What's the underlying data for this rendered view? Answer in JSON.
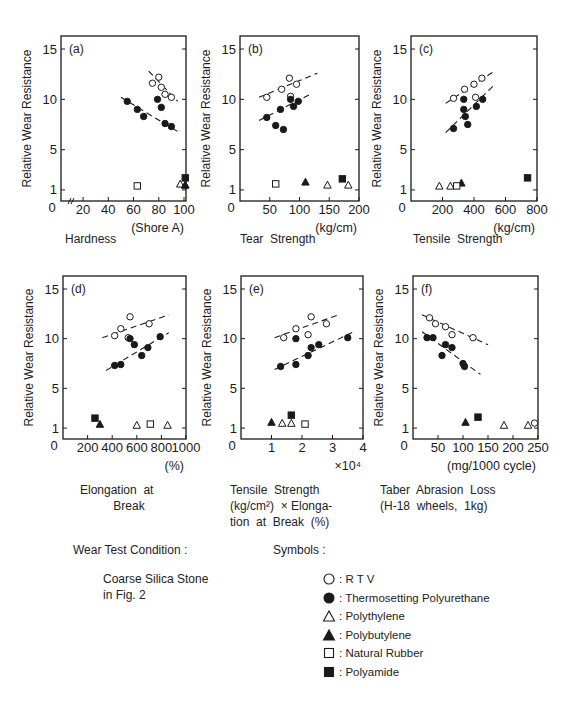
{
  "figure": {
    "ylabel": "Relative Wear Resistance",
    "colors": {
      "ink": "#1a1a1a",
      "background": "#ffffff"
    }
  },
  "symbols_legend": {
    "title": "Symbols :",
    "items": [
      {
        "marker": "open-circle",
        "label": "R T V"
      },
      {
        "marker": "filled-circle",
        "label": "Thermosetting Polyurethane"
      },
      {
        "marker": "open-triangle",
        "label": "Polythylene"
      },
      {
        "marker": "filled-triangle",
        "label": "Polybutylene"
      },
      {
        "marker": "open-square",
        "label": "Natural Rubber"
      },
      {
        "marker": "filled-square",
        "label": "Polyamide"
      }
    ]
  },
  "wear_test": {
    "title": "Wear Test Condition :",
    "line1": "Coarse Silica Stone",
    "line2": "in Fig. 2"
  },
  "chart_data": [
    {
      "id": "a",
      "type": "scatter",
      "panel_label": "(a)",
      "title": "Hardness",
      "xlabel": "(Shore A)",
      "ylabel": "Relative Wear Resistance",
      "xlim": [
        0,
        100
      ],
      "ylim": [
        0,
        16
      ],
      "xticks": [
        20,
        40,
        60,
        80,
        100
      ],
      "yticks": [
        1,
        5,
        10,
        15
      ],
      "axis_break": true,
      "box": {
        "x": 61,
        "y": 36,
        "w": 125,
        "h": 165
      },
      "xmap": [
        12,
        100
      ],
      "xpix": [
        73,
        184
      ],
      "series": [
        {
          "name": "R T V",
          "marker": "open-circle",
          "points": [
            [
              75,
              11.6
            ],
            [
              80,
              12.2
            ],
            [
              82,
              11.2
            ],
            [
              85,
              10.5
            ],
            [
              90,
              10.2
            ]
          ]
        },
        {
          "name": "Thermosetting Polyurethane",
          "marker": "filled-circle",
          "points": [
            [
              55,
              9.8
            ],
            [
              63,
              9.0
            ],
            [
              68,
              8.3
            ],
            [
              79,
              10.0
            ],
            [
              82,
              9.2
            ],
            [
              85,
              7.6
            ],
            [
              90,
              7.3
            ]
          ]
        },
        {
          "name": "Polythylene",
          "marker": "open-triangle",
          "points": [
            [
              97,
              1.6
            ],
            [
              101,
              1.5
            ]
          ]
        },
        {
          "name": "Polybutylene",
          "marker": "filled-triangle",
          "points": [
            [
              101,
              1.5
            ]
          ]
        },
        {
          "name": "Natural Rubber",
          "marker": "open-square",
          "points": [
            [
              63,
              1.4
            ]
          ]
        },
        {
          "name": "Polyamide",
          "marker": "filled-square",
          "points": [
            [
              101,
              2.2
            ]
          ]
        }
      ],
      "trendlines": [
        {
          "series": "R T V",
          "from": [
            72,
            12.8
          ],
          "to": [
            95,
            9.8
          ]
        },
        {
          "series": "Thermosetting Polyurethane",
          "from": [
            50,
            10.2
          ],
          "to": [
            95,
            6.8
          ]
        }
      ]
    },
    {
      "id": "b",
      "type": "scatter",
      "panel_label": "(b)",
      "title": "Tear Strength",
      "xlabel": "(kg/cm)",
      "ylabel": "Relative Wear Resistance",
      "xlim": [
        0,
        200
      ],
      "ylim": [
        0,
        16
      ],
      "xticks": [
        50,
        100,
        150,
        200
      ],
      "yticks": [
        1,
        5,
        10,
        15
      ],
      "box": {
        "x": 240,
        "y": 36,
        "w": 119,
        "h": 165
      },
      "series": [
        {
          "name": "R T V",
          "marker": "open-circle",
          "points": [
            [
              45,
              10.2
            ],
            [
              70,
              11.0
            ],
            [
              83,
              12.1
            ],
            [
              85,
              10.3
            ],
            [
              95,
              11.5
            ]
          ]
        },
        {
          "name": "Thermosetting Polyurethane",
          "marker": "filled-circle",
          "points": [
            [
              45,
              8.2
            ],
            [
              60,
              7.4
            ],
            [
              68,
              9.0
            ],
            [
              73,
              7.0
            ],
            [
              85,
              10.0
            ],
            [
              90,
              9.3
            ],
            [
              98,
              9.8
            ]
          ]
        },
        {
          "name": "Polythylene",
          "marker": "open-triangle",
          "points": [
            [
              147,
              1.5
            ],
            [
              182,
              1.5
            ]
          ]
        },
        {
          "name": "Polybutylene",
          "marker": "filled-triangle",
          "points": [
            [
              110,
              1.8
            ]
          ]
        },
        {
          "name": "Natural Rubber",
          "marker": "open-square",
          "points": [
            [
              60,
              1.6
            ]
          ]
        },
        {
          "name": "Polyamide",
          "marker": "filled-square",
          "points": [
            [
              172,
              2.1
            ]
          ]
        }
      ],
      "trendlines": [
        {
          "series": "R T V",
          "from": [
            32,
            10.2
          ],
          "to": [
            130,
            12.6
          ]
        },
        {
          "series": "Thermosetting Polyurethane",
          "from": [
            32,
            7.9
          ],
          "to": [
            118,
            10.5
          ]
        }
      ]
    },
    {
      "id": "c",
      "type": "scatter",
      "panel_label": "(c)",
      "title": "Tensile Strength",
      "xlabel": "(kg/cm)",
      "ylabel": "Relative Wear Resistance",
      "xlim": [
        0,
        800
      ],
      "ylim": [
        0,
        16
      ],
      "xticks": [
        200,
        400,
        600,
        800
      ],
      "yticks": [
        1,
        5,
        10,
        15
      ],
      "box": {
        "x": 411,
        "y": 36,
        "w": 126,
        "h": 165
      },
      "series": [
        {
          "name": "R T V",
          "marker": "open-circle",
          "points": [
            [
              270,
              10.1
            ],
            [
              340,
              11.0
            ],
            [
              400,
              11.5
            ],
            [
              410,
              10.2
            ],
            [
              450,
              12.1
            ]
          ]
        },
        {
          "name": "Thermosetting Polyurethane",
          "marker": "filled-circle",
          "points": [
            [
              270,
              7.1
            ],
            [
              335,
              10.0
            ],
            [
              335,
              9.0
            ],
            [
              345,
              8.3
            ],
            [
              360,
              7.5
            ],
            [
              415,
              9.3
            ],
            [
              455,
              10.0
            ]
          ]
        },
        {
          "name": "Polythylene",
          "marker": "open-triangle",
          "points": [
            [
              180,
              1.4
            ],
            [
              250,
              1.4
            ]
          ]
        },
        {
          "name": "Polybutylene",
          "marker": "filled-triangle",
          "points": [
            [
              320,
              1.7
            ]
          ]
        },
        {
          "name": "Natural Rubber",
          "marker": "open-square",
          "points": [
            [
              290,
              1.4
            ]
          ]
        },
        {
          "name": "Polyamide",
          "marker": "filled-square",
          "points": [
            [
              740,
              2.2
            ]
          ]
        }
      ],
      "trendlines": [
        {
          "series": "R T V",
          "from": [
            220,
            9.6
          ],
          "to": [
            530,
            12.8
          ]
        },
        {
          "series": "Thermosetting Polyurethane",
          "from": [
            220,
            6.7
          ],
          "to": [
            520,
            11.3
          ]
        }
      ]
    },
    {
      "id": "d",
      "type": "scatter",
      "panel_label": "(d)",
      "title": "Elongation at Break",
      "xlabel": "(%)",
      "ylabel": "Relative Wear Resistance",
      "xlim": [
        0,
        1000
      ],
      "ylim": [
        0,
        16
      ],
      "xticks": [
        200,
        400,
        600,
        800,
        1000
      ],
      "yticks": [
        1,
        5,
        10,
        15
      ],
      "box": {
        "x": 63,
        "y": 276,
        "w": 123,
        "h": 163
      },
      "series": [
        {
          "name": "R T V",
          "marker": "open-circle",
          "points": [
            [
              420,
              10.3
            ],
            [
              470,
              11.0
            ],
            [
              530,
              10.1
            ],
            [
              545,
              12.2
            ],
            [
              700,
              11.5
            ]
          ]
        },
        {
          "name": "Thermosetting Polyurethane",
          "marker": "filled-circle",
          "points": [
            [
              420,
              7.3
            ],
            [
              470,
              7.4
            ],
            [
              545,
              10.0
            ],
            [
              580,
              9.4
            ],
            [
              640,
              8.3
            ],
            [
              690,
              9.1
            ],
            [
              790,
              10.2
            ]
          ]
        },
        {
          "name": "Polythylene",
          "marker": "open-triangle",
          "points": [
            [
              600,
              1.3
            ],
            [
              850,
              1.3
            ]
          ]
        },
        {
          "name": "Polybutylene",
          "marker": "filled-triangle",
          "points": [
            [
              300,
              1.4
            ]
          ]
        },
        {
          "name": "Natural Rubber",
          "marker": "open-square",
          "points": [
            [
              710,
              1.4
            ]
          ]
        },
        {
          "name": "Polyamide",
          "marker": "filled-square",
          "points": [
            [
              260,
              2.0
            ]
          ]
        }
      ],
      "trendlines": [
        {
          "series": "R T V",
          "from": [
            320,
            10.1
          ],
          "to": [
            860,
            12.4
          ]
        },
        {
          "series": "Thermosetting Polyurethane",
          "from": [
            350,
            6.8
          ],
          "to": [
            860,
            10.6
          ]
        }
      ]
    },
    {
      "id": "e",
      "type": "scatter",
      "panel_label": "(e)",
      "title": "Tensile Strength (kg/cm²) × Elongation at Break (%)",
      "xlabel": "×10⁴",
      "ylabel": "Relative Wear Resistance",
      "xlim": [
        0,
        4
      ],
      "ylim": [
        0,
        16
      ],
      "xticks": [
        1,
        2,
        3,
        4
      ],
      "yticks": [
        1,
        5,
        10,
        15
      ],
      "box": {
        "x": 241,
        "y": 276,
        "w": 122,
        "h": 163
      },
      "series": [
        {
          "name": "R T V",
          "marker": "open-circle",
          "points": [
            [
              1.4,
              10.1
            ],
            [
              1.8,
              11.0
            ],
            [
              2.2,
              10.4
            ],
            [
              2.3,
              12.2
            ],
            [
              2.8,
              11.5
            ]
          ]
        },
        {
          "name": "Thermosetting Polyurethane",
          "marker": "filled-circle",
          "points": [
            [
              1.3,
              7.2
            ],
            [
              1.8,
              10.0
            ],
            [
              1.8,
              7.4
            ],
            [
              2.2,
              8.3
            ],
            [
              2.3,
              9.1
            ],
            [
              2.55,
              9.4
            ],
            [
              3.5,
              10.1
            ]
          ]
        },
        {
          "name": "Polythylene",
          "marker": "open-triangle",
          "points": [
            [
              1.35,
              1.5
            ],
            [
              1.65,
              1.5
            ]
          ]
        },
        {
          "name": "Polybutylene",
          "marker": "filled-triangle",
          "points": [
            [
              1.0,
              1.6
            ]
          ]
        },
        {
          "name": "Natural Rubber",
          "marker": "open-square",
          "points": [
            [
              2.1,
              1.4
            ]
          ]
        },
        {
          "name": "Polyamide",
          "marker": "filled-square",
          "points": [
            [
              1.65,
              2.3
            ]
          ]
        }
      ],
      "trendlines": [
        {
          "series": "R T V",
          "from": [
            1.1,
            10.1
          ],
          "to": [
            3.2,
            12.4
          ]
        },
        {
          "series": "Thermosetting Polyurethane",
          "from": [
            1.1,
            6.9
          ],
          "to": [
            3.7,
            10.7
          ]
        }
      ]
    },
    {
      "id": "f",
      "type": "scatter",
      "panel_label": "(f)",
      "title": "Taber Abrasion Loss (H-18 wheels, 1kg)",
      "xlabel": "(mg/1000 cycle)",
      "ylabel": "Relative Wear Resistance",
      "xlim": [
        0,
        250
      ],
      "ylim": [
        0,
        16
      ],
      "xticks": [
        50,
        100,
        150,
        200,
        250
      ],
      "yticks": [
        1,
        5,
        10,
        15
      ],
      "box": {
        "x": 413,
        "y": 276,
        "w": 125,
        "h": 163
      },
      "series": [
        {
          "name": "R T V",
          "marker": "open-circle",
          "points": [
            [
              33,
              12.1
            ],
            [
              45,
              11.5
            ],
            [
              65,
              11.2
            ],
            [
              78,
              10.4
            ],
            [
              120,
              10.1
            ],
            [
              243,
              1.5
            ]
          ]
        },
        {
          "name": "Thermosetting Polyurethane",
          "marker": "filled-circle",
          "points": [
            [
              28,
              10.1
            ],
            [
              40,
              10.1
            ],
            [
              58,
              8.3
            ],
            [
              65,
              9.4
            ],
            [
              78,
              9.1
            ],
            [
              100,
              7.5
            ],
            [
              103,
              7.2
            ]
          ]
        },
        {
          "name": "Polythylene",
          "marker": "open-triangle",
          "points": [
            [
              182,
              1.3
            ],
            [
              230,
              1.3
            ]
          ]
        },
        {
          "name": "Polybutylene",
          "marker": "filled-triangle",
          "points": [
            [
              105,
              1.6
            ]
          ]
        },
        {
          "name": "Natural Rubber",
          "marker": "open-square",
          "points": []
        },
        {
          "name": "Polyamide",
          "marker": "filled-square",
          "points": [
            [
              130,
              2.1
            ]
          ]
        }
      ],
      "trendlines": [
        {
          "series": "R T V",
          "from": [
            18,
            12.4
          ],
          "to": [
            150,
            9.4
          ]
        },
        {
          "series": "Thermosetting Polyurethane",
          "from": [
            18,
            10.7
          ],
          "to": [
            135,
            6.4
          ]
        }
      ]
    }
  ],
  "panel_titles": {
    "a": [
      "Hardness"
    ],
    "b": [
      "Tear  Strength"
    ],
    "c": [
      "Tensile  Strength"
    ],
    "d": [
      "Elongation  at",
      "          Break"
    ],
    "e": [
      "Tensile  Strength",
      "(kg/cm²)  × Elonga-",
      "tion  at  Break  (%)"
    ],
    "f": [
      "Taber  Abrasion  Loss",
      "(H-18  wheels,  1kg)"
    ]
  }
}
